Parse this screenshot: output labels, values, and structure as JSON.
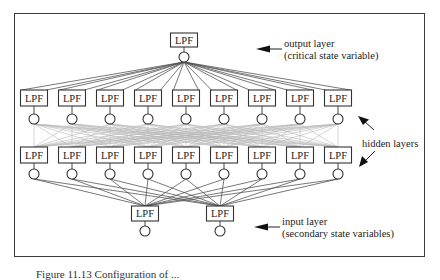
{
  "figure": {
    "node_label": "LPF",
    "colors": {
      "frame": "#3a3a3a",
      "node_stroke": "#333333",
      "strong_line": "#555555",
      "mesh_line": "#b8b8b8",
      "text": "#222222"
    },
    "layers": [
      {
        "name": "output",
        "count": 1,
        "x": [
          184
        ],
        "box_top": 33,
        "box_h": 14,
        "circle_cy": 57
      },
      {
        "name": "hidden-1",
        "count": 9,
        "x": [
          34,
          72,
          110,
          148,
          186,
          224,
          262,
          300,
          338
        ],
        "box_top": 90,
        "box_h": 16,
        "circle_cy": 119
      },
      {
        "name": "hidden-2",
        "count": 9,
        "x": [
          34,
          72,
          110,
          148,
          186,
          224,
          262,
          300,
          338
        ],
        "box_top": 147,
        "box_h": 16,
        "circle_cy": 174
      },
      {
        "name": "input",
        "count": 2,
        "x": [
          145,
          220
        ],
        "box_top": 206,
        "box_h": 15,
        "circle_cy": 231
      }
    ],
    "annotations": {
      "output_layer": {
        "line1": "output layer",
        "line2": "(critical state variable)"
      },
      "hidden_layers": {
        "label": "hidden layers"
      },
      "input_layer": {
        "line1": "input layer",
        "line2": "(secondary state variables)"
      }
    },
    "caption": "Figure 11.13  Configuration of ..."
  }
}
